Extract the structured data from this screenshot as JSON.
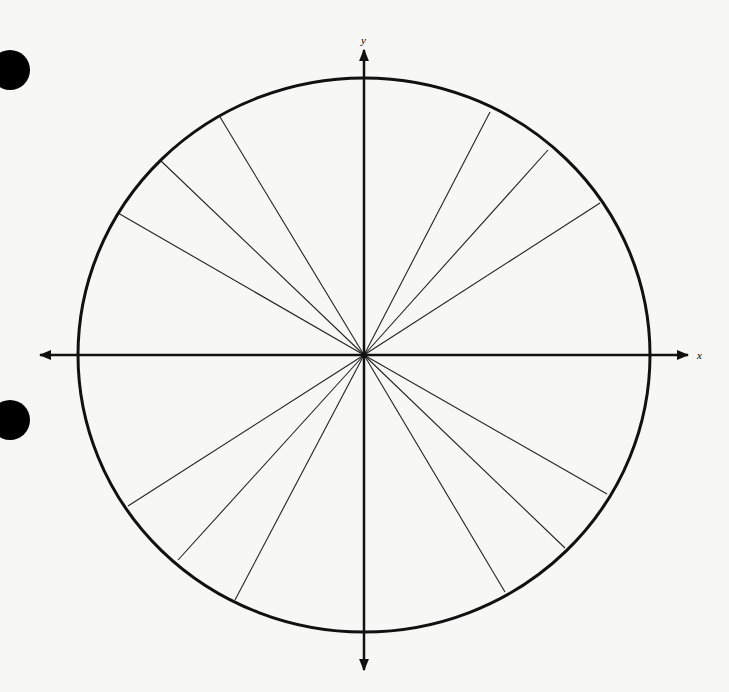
{
  "diagram": {
    "center": [
      364,
      355
    ],
    "radius_x": 286,
    "radius_y": 277,
    "axis_labels": {
      "x": "x",
      "y": "y"
    },
    "axes": {
      "x": {
        "from": [
          40,
          355
        ],
        "to": [
          688,
          355
        ]
      },
      "y": {
        "from": [
          364,
          50
        ],
        "to": [
          364,
          670
        ]
      }
    },
    "spokes": [
      [
        490,
        112
      ],
      [
        548,
        150
      ],
      [
        600,
        203
      ],
      [
        220,
        117
      ],
      [
        160,
        160
      ],
      [
        118,
        213
      ],
      [
        128,
        506
      ],
      [
        178,
        560
      ],
      [
        235,
        600
      ],
      [
        505,
        592
      ],
      [
        565,
        548
      ],
      [
        607,
        494
      ]
    ],
    "spoke_angles_deg": [
      60,
      45,
      30,
      120,
      135,
      150,
      210,
      225,
      240,
      300,
      315,
      330
    ],
    "hole_punches": [
      [
        10,
        70
      ],
      [
        10,
        420
      ]
    ],
    "colors": {
      "stroke": "#111111",
      "background": "#f7f7f6"
    }
  }
}
